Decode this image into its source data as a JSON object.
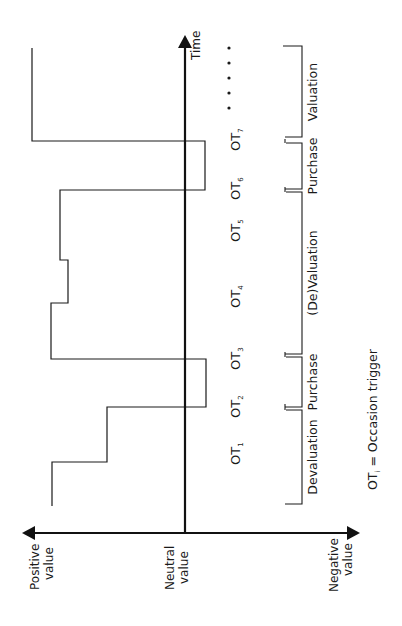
{
  "diagram": {
    "orientation": "rotated-90-ccw",
    "axes": {
      "time_label": "Time",
      "value_positive": [
        "Positive",
        "value"
      ],
      "value_neutral": [
        "Neutral",
        "value"
      ],
      "value_negative": [
        "Negative",
        "value"
      ]
    },
    "occasion_triggers": [
      {
        "base": "OT",
        "sub": "1"
      },
      {
        "base": "OT",
        "sub": "2"
      },
      {
        "base": "OT",
        "sub": "3"
      },
      {
        "base": "OT",
        "sub": "4"
      },
      {
        "base": "OT",
        "sub": "5"
      },
      {
        "base": "OT",
        "sub": "6"
      },
      {
        "base": "OT",
        "sub": "7"
      }
    ],
    "continuation": "• • • • •",
    "phases": [
      {
        "label": "Devaluation"
      },
      {
        "label": "Purchase"
      },
      {
        "label": "(De)Valuation"
      },
      {
        "label": "Purchase"
      },
      {
        "label": "Valuation"
      }
    ],
    "footnote": {
      "base": "OT",
      "sub": "i",
      "text": " = Occasion trigger"
    },
    "value_path_description": "Stepwise value curve over time: declines in devaluation, drops below neutral at purchase, rises during (de)valuation, dips at second purchase, then rises to high value during valuation"
  }
}
